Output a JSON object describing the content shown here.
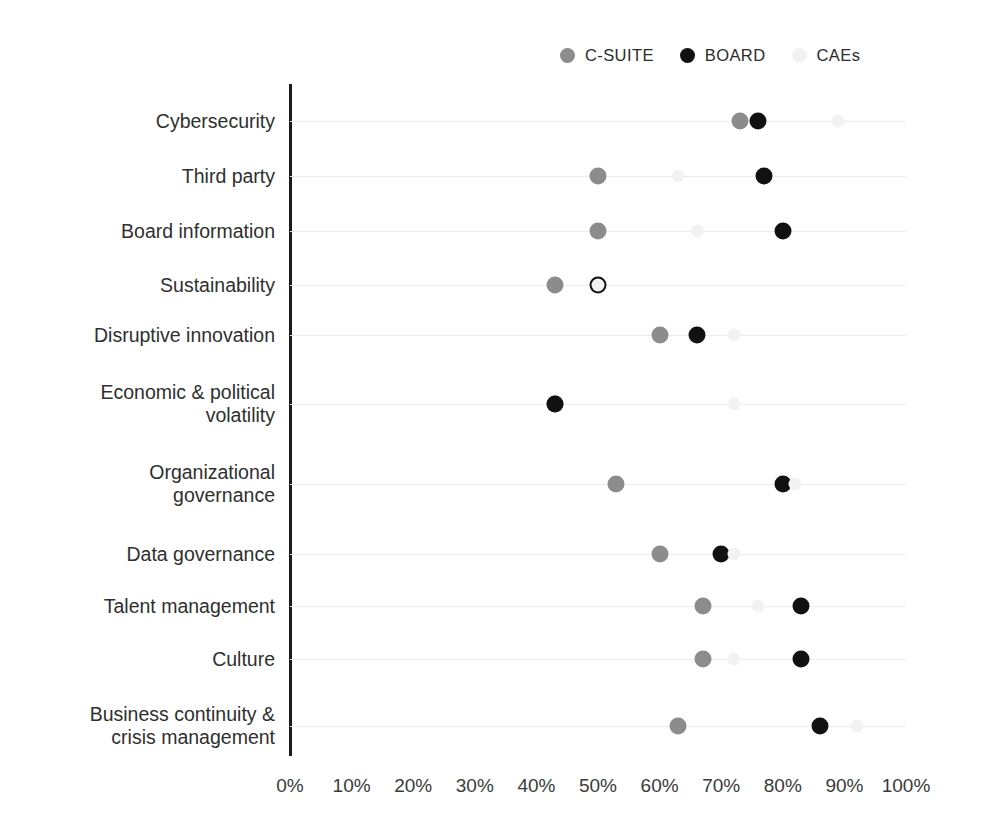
{
  "chart_data": {
    "type": "scatter",
    "title": "",
    "subtitle": "",
    "xlabel": "",
    "ylabel": "",
    "xlim": [
      0,
      100
    ],
    "xticks": [
      0,
      10,
      20,
      30,
      40,
      50,
      60,
      70,
      80,
      90,
      100
    ],
    "xtick_labels": [
      "0%",
      "10%",
      "20%",
      "30%",
      "40%",
      "50%",
      "60%",
      "70%",
      "80%",
      "90%",
      "100%"
    ],
    "grid": true,
    "legend_position": "top-right",
    "categories": [
      "Cybersecurity",
      "Third party",
      "Board information",
      "Sustainability",
      "Disruptive innovation",
      "Economic & political\nvolatility",
      "Organizational\ngovernance",
      "Data governance",
      "Talent management",
      "Culture",
      "Business continuity &\ncrisis management"
    ],
    "series": [
      {
        "name": "C-SUITE",
        "color": "#8c8c8c",
        "values": [
          73,
          50,
          50,
          43,
          60,
          43,
          53,
          60,
          67,
          67,
          63
        ]
      },
      {
        "name": "BOARD",
        "color": "#111111",
        "values": [
          76,
          77,
          80,
          50,
          66,
          43,
          80,
          70,
          83,
          83,
          86
        ]
      },
      {
        "name": "CAEs",
        "color": "#f2f2f2",
        "values": [
          89,
          63,
          66,
          50,
          72,
          72,
          82,
          72,
          76,
          72,
          92
        ]
      }
    ]
  },
  "legend": {
    "items": [
      {
        "label": "C-SUITE",
        "color": "#8c8c8c"
      },
      {
        "label": "BOARD",
        "color": "#111111"
      },
      {
        "label": "CAEs",
        "color": "#f2f2f2"
      }
    ]
  },
  "colors": {
    "background": "#ffffff",
    "axis": "#1a1a1a",
    "gridline": "#ececec",
    "text": "#2f2f2f",
    "c_suite": "#8c8c8c",
    "board": "#111111",
    "caes": "#f2f2f2"
  }
}
